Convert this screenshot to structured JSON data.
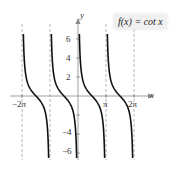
{
  "chart_data": {
    "type": "line",
    "title": "",
    "legend": [
      "f(x) = cot x"
    ],
    "xlabel": "x",
    "ylabel": "y",
    "x_ticks": [
      "−2π",
      "π",
      "2π"
    ],
    "y_ticks": [
      "6",
      "4",
      "2",
      "−4",
      "−6"
    ],
    "asymptotes": [
      "-2π",
      "-π",
      "0",
      "π",
      "2π"
    ],
    "series": [
      {
        "name": "f(x) = cot x",
        "function": "cot(x)"
      }
    ],
    "xlim": [
      "-2π",
      "2π"
    ],
    "ylim": [
      -7,
      7
    ],
    "grid": false
  },
  "labels": {
    "xaxis": "x",
    "yaxis": "y",
    "legend": "f(x) = cot x",
    "neg2pi": "−2π",
    "pi": "π",
    "twopi": "2π",
    "y6": "6",
    "y4": "4",
    "y2": "2",
    "yn4": "−4",
    "yn6": "−6"
  }
}
